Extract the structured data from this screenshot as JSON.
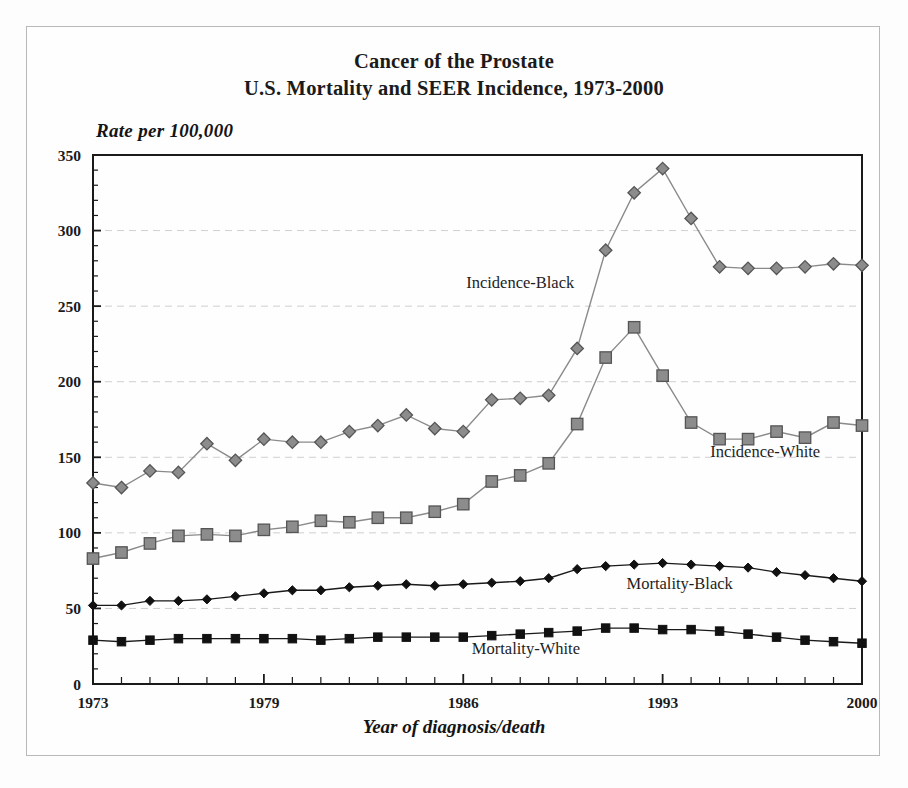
{
  "figure": {
    "title_line1": "Cancer of the Prostate",
    "title_line2": "U.S. Mortality and SEER Incidence, 1973-2000",
    "ylabel": "Rate per 100,000",
    "xlabel": "Year of diagnosis/death",
    "background": "#fefefe",
    "frame_color": "#b9b9b9"
  },
  "chart_data": {
    "type": "line",
    "title": "Cancer of the Prostate\nU.S. Mortality and SEER Incidence, 1973-2000",
    "xlabel": "Year of diagnosis/death",
    "ylabel": "Rate per 100,000",
    "xlim": [
      1973,
      2000
    ],
    "ylim": [
      0,
      350
    ],
    "yticks": [
      0,
      50,
      100,
      150,
      200,
      250,
      300,
      350
    ],
    "ytick_labels": [
      "0",
      "50",
      "100",
      "150",
      "200",
      "250",
      "300",
      "350"
    ],
    "y_minor_tick_step": 10,
    "xticks": [
      1973,
      1979,
      1986,
      1993,
      2000
    ],
    "xtick_labels": [
      "1973",
      "1979",
      "1986",
      "1993",
      "2000"
    ],
    "x_minor_tick_step": 1,
    "grid": "horizontal-dashed-major",
    "grid_color": "#cfcfcf",
    "legend": "inline-annotations",
    "x": [
      1973,
      1974,
      1975,
      1976,
      1977,
      1978,
      1979,
      1980,
      1981,
      1982,
      1983,
      1984,
      1985,
      1986,
      1987,
      1988,
      1989,
      1990,
      1991,
      1992,
      1993,
      1994,
      1995,
      1996,
      1997,
      1998,
      1999,
      2000
    ],
    "series": [
      {
        "name": "Incidence-Black",
        "marker": "diamond",
        "marker_fill": "#8c8c8c",
        "marker_edge": "#555555",
        "line_color": "#8a8a8a",
        "annotation": "Incidence-Black",
        "values": [
          133,
          130,
          141,
          140,
          159,
          148,
          162,
          160,
          160,
          167,
          171,
          178,
          169,
          167,
          188,
          189,
          191,
          222,
          287,
          325,
          341,
          308,
          276,
          275,
          275,
          276,
          278,
          277
        ]
      },
      {
        "name": "Incidence-White",
        "marker": "square",
        "marker_fill": "#8c8c8c",
        "marker_edge": "#555555",
        "line_color": "#8a8a8a",
        "annotation": "Incidence-White",
        "values": [
          83,
          87,
          93,
          98,
          99,
          98,
          102,
          104,
          108,
          107,
          110,
          110,
          114,
          119,
          134,
          138,
          146,
          172,
          216,
          236,
          204,
          173,
          162,
          162,
          167,
          163,
          173,
          171
        ]
      },
      {
        "name": "Mortality-Black",
        "marker": "diamond",
        "marker_fill": "#111111",
        "marker_edge": "#111111",
        "line_color": "#1a1a1a",
        "annotation": "Mortality-Black",
        "values": [
          52,
          52,
          55,
          55,
          56,
          58,
          60,
          62,
          62,
          64,
          65,
          66,
          65,
          66,
          67,
          68,
          70,
          76,
          78,
          79,
          80,
          79,
          78,
          77,
          74,
          72,
          70,
          68
        ]
      },
      {
        "name": "Mortality-White",
        "marker": "square",
        "marker_fill": "#111111",
        "marker_edge": "#111111",
        "line_color": "#1a1a1a",
        "annotation": "Mortality-White",
        "values": [
          29,
          28,
          29,
          30,
          30,
          30,
          30,
          30,
          29,
          30,
          31,
          31,
          31,
          31,
          32,
          33,
          34,
          35,
          37,
          37,
          36,
          36,
          35,
          33,
          31,
          29,
          28,
          27
        ]
      }
    ],
    "annotations": [
      {
        "text": "Incidence-Black",
        "x": 1988.0,
        "y": 262
      },
      {
        "text": "Incidence-White",
        "x": 1996.6,
        "y": 150
      },
      {
        "text": "Mortality-Black",
        "x": 1993.6,
        "y": 63
      },
      {
        "text": "Mortality-White",
        "x": 1988.2,
        "y": 20
      }
    ]
  }
}
